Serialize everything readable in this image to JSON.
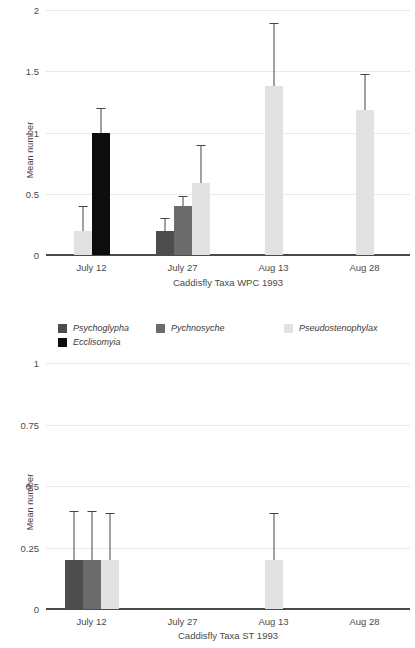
{
  "legend": {
    "position": "below-top-chart",
    "entries": [
      {
        "label": "Psychoglypha",
        "color": "#4d4d4d"
      },
      {
        "label": "Pychnosyche",
        "color": "#6b6b6b"
      },
      {
        "label": "Pseudostenophylax",
        "color": "#e2e2e2"
      },
      {
        "label": "Ecclisomyia",
        "color": "#0d0d0d"
      }
    ]
  },
  "chart_data": [
    {
      "type": "bar",
      "id": "wpc-1993",
      "title": "",
      "xlabel": "Caddisfly Taxa WPC 1993",
      "ylabel": "Mean number",
      "categories": [
        "July 12",
        "July 27",
        "Aug 13",
        "Aug 28"
      ],
      "ylim": [
        0,
        2
      ],
      "yticks": [
        "0",
        "0.5",
        "1",
        "1.5",
        "2"
      ],
      "ytick_values": [
        0,
        0.5,
        1,
        1.5,
        2
      ],
      "grid": true,
      "legend": "external",
      "series": [
        {
          "name": "Psychoglypha",
          "color": "#4d4d4d",
          "values": [
            null,
            0.2,
            null,
            null
          ],
          "errors_upper": [
            null,
            0.3,
            null,
            null
          ]
        },
        {
          "name": "Pychnosyche",
          "color": "#6b6b6b",
          "values": [
            null,
            0.4,
            null,
            null
          ],
          "errors_upper": [
            null,
            0.48,
            null,
            null
          ]
        },
        {
          "name": "Pseudostenophylax",
          "color": "#e2e2e2",
          "values": [
            0.2,
            0.59,
            1.38,
            1.18
          ],
          "errors_upper": [
            0.4,
            0.9,
            1.89,
            1.48
          ]
        },
        {
          "name": "Ecclisomyia",
          "color": "#0d0d0d",
          "values": [
            1.0,
            null,
            null,
            null
          ],
          "errors_upper": [
            1.2,
            null,
            null,
            null
          ]
        }
      ]
    },
    {
      "type": "bar",
      "id": "st-1993",
      "title": "",
      "xlabel": "Caddisfly Taxa ST 1993",
      "ylabel": "Mean number",
      "categories": [
        "July 12",
        "July 27",
        "Aug 13",
        "Aug 28"
      ],
      "ylim": [
        0,
        1
      ],
      "yticks": [
        "0",
        "0.25",
        "0.5",
        "0.75",
        "1"
      ],
      "ytick_values": [
        0,
        0.25,
        0.5,
        0.75,
        1
      ],
      "grid": true,
      "legend": "external",
      "series": [
        {
          "name": "Psychoglypha",
          "color": "#4d4d4d",
          "values": [
            0.2,
            null,
            null,
            null
          ],
          "errors_upper": [
            0.4,
            null,
            null,
            null
          ]
        },
        {
          "name": "Pychnosyche",
          "color": "#6b6b6b",
          "values": [
            0.2,
            null,
            null,
            null
          ],
          "errors_upper": [
            0.4,
            null,
            null,
            null
          ]
        },
        {
          "name": "Pseudostenophylax",
          "color": "#e2e2e2",
          "values": [
            0.2,
            null,
            0.2,
            null
          ],
          "errors_upper": [
            0.39,
            null,
            0.39,
            null
          ]
        },
        {
          "name": "Ecclisomyia",
          "color": "#0d0d0d",
          "values": [
            null,
            null,
            null,
            null
          ],
          "errors_upper": [
            null,
            null,
            null,
            null
          ]
        }
      ]
    }
  ]
}
